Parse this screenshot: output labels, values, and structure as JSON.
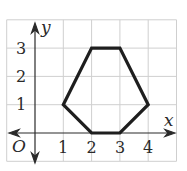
{
  "figure": {
    "type": "coordinate-grid-polygon",
    "axes": {
      "x_label": "x",
      "y_label": "y",
      "origin_label": "O",
      "x_ticks": [
        "1",
        "2",
        "3",
        "4"
      ],
      "y_ticks": [
        "1",
        "2",
        "3"
      ]
    },
    "grid": {
      "x_min": -1,
      "x_max": 5,
      "y_min": -1,
      "y_max": 4,
      "color": "#cfcfcf"
    },
    "polygon": {
      "name": "hexagon",
      "vertices": [
        [
          2,
          3
        ],
        [
          3,
          3
        ],
        [
          4,
          1
        ],
        [
          3,
          0
        ],
        [
          2,
          0
        ],
        [
          1,
          1
        ]
      ],
      "stroke": "#1e1e1e"
    },
    "colors": {
      "axis": "#2a2a2a",
      "text": "#2a2a2a",
      "background": "#ffffff"
    }
  }
}
